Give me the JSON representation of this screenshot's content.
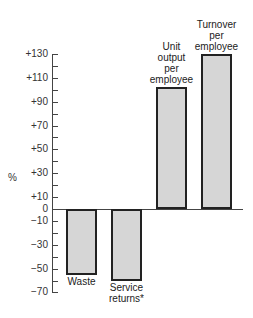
{
  "chart_data": {
    "type": "bar",
    "title": "",
    "xlabel": "",
    "ylabel": "%",
    "ylim": [
      -70,
      130
    ],
    "yticks_labeled": [
      130,
      110,
      90,
      70,
      50,
      30,
      10,
      0,
      -10,
      -30,
      -50,
      -70
    ],
    "ytick_labels": [
      "+130",
      "+110",
      "+90",
      "+70",
      "+50",
      "+30",
      "+10",
      "0",
      "−10",
      "−30",
      "−50",
      "−70"
    ],
    "yticks_minor_step": 10,
    "grid": false,
    "legend": null,
    "categories": [
      "Waste",
      "Service returns*",
      "Unit output per employee",
      "Turnover per employee"
    ],
    "category_label_lines": [
      [
        "Waste"
      ],
      [
        "Service",
        "returns*"
      ],
      [
        "Unit",
        "output",
        "per",
        "employee"
      ],
      [
        "Turnover",
        "per",
        "employee"
      ]
    ],
    "values": [
      -55,
      -60,
      102,
      130
    ],
    "bar_color": "#d6d6d6",
    "bar_edge_color": "#222222"
  },
  "axis": {
    "ylabel": "%"
  }
}
